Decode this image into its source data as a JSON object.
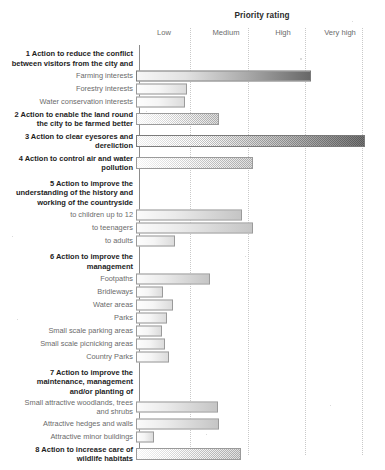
{
  "chart_data": {
    "type": "bar",
    "orientation": "horizontal",
    "title": "Priority rating",
    "xlabel": "",
    "ylabel": "",
    "grid": true,
    "legend": "none",
    "tick_labels": [
      "Low",
      "Medium",
      "High",
      "Very high"
    ],
    "tick_positions": [
      0.9,
      2.0,
      3.0,
      4.0
    ],
    "xlim": [
      0,
      4.4
    ],
    "categories": [
      "1 Action to reduce the conflict between visitors from the city and",
      "Farming interests",
      "Forestry interests",
      "Water conservation interests",
      "2 Action to enable the land round the city to be farmed better",
      "3 Action to clear eyesores and dereliction",
      "4 Action to control air and water pollution",
      "5 Action to improve the understanding of the history and working of the countryside",
      "to children up to 12",
      "to teenagers",
      "to adults",
      "6 Action to improve the management",
      "Footpaths",
      "Bridleways",
      "Water areas",
      "Parks",
      "Small scale parking areas",
      "Small scale picnicking areas",
      "Country Parks",
      "7 Action to improve the maintenance, management and/or planting of",
      "Small attractive woodlands, trees and shrubs",
      "Attractive hedges and walls",
      "Attractive minor buildings",
      "8 Action to increase care of wildlife habitats"
    ],
    "values": [
      null,
      3.1,
      0.9,
      0.88,
      1.5,
      4.1,
      2.1,
      null,
      1.9,
      2.1,
      0.7,
      null,
      1.33,
      0.49,
      0.67,
      0.56,
      0.47,
      0.52,
      0.6,
      null,
      1.48,
      1.5,
      0.32,
      1.88
    ]
  },
  "chart": {
    "title": "Priority rating",
    "axis": {
      "ticks": [
        {
          "label": "Low",
          "x_px": 164
        },
        {
          "label": "Medium",
          "x_px": 226
        },
        {
          "label": "High",
          "x_px": 283
        },
        {
          "label": "Very high",
          "x_px": 340
        }
      ],
      "gridlines_px": [
        190,
        248,
        305,
        362
      ]
    },
    "rows": [
      {
        "id": "heading-1",
        "label": "1 Action to reduce the conflict\nbetween visitors from the city and",
        "kind": "heading",
        "clipped": true,
        "bar": null,
        "top": 48,
        "height": 21
      },
      {
        "id": "farming-interests",
        "label": "Farming interests",
        "kind": "item",
        "bar": {
          "width_px": 175,
          "style": "dark"
        },
        "top": 69,
        "height": 13
      },
      {
        "id": "forestry-interests",
        "label": "Forestry interests",
        "kind": "item",
        "bar": {
          "width_px": 51,
          "style": "light"
        },
        "top": 82,
        "height": 13
      },
      {
        "id": "water-conservation-interests",
        "label": "Water conservation interests",
        "kind": "item",
        "bar": {
          "width_px": 49,
          "style": "light"
        },
        "top": 95,
        "height": 13
      },
      {
        "id": "heading-2",
        "label": "2 Action to enable the land round\nthe city to be farmed better",
        "kind": "heading",
        "bar": {
          "width_px": 83,
          "style": "normal"
        },
        "top": 108,
        "height": 22
      },
      {
        "id": "heading-3",
        "label": "3 Action to clear eyesores and\ndereliction",
        "kind": "heading",
        "bar": {
          "width_px": 229,
          "style": "dark"
        },
        "top": 130,
        "height": 22
      },
      {
        "id": "heading-4",
        "label": "4 Action to control air and water\npollution",
        "kind": "heading",
        "bar": {
          "width_px": 117,
          "style": "normal"
        },
        "top": 152,
        "height": 22
      },
      {
        "id": "heading-5",
        "label": "5 Action to improve the\nunderstanding of the history and\nworking of the countryside",
        "kind": "heading",
        "bar": null,
        "top": 178,
        "height": 30
      },
      {
        "id": "to-children-up-to-12",
        "label": "to children up to 12",
        "kind": "item",
        "bar": {
          "width_px": 106,
          "style": "normal"
        },
        "top": 208,
        "height": 13
      },
      {
        "id": "to-teenagers",
        "label": "to teenagers",
        "kind": "item",
        "bar": {
          "width_px": 117,
          "style": "normal"
        },
        "top": 221,
        "height": 13
      },
      {
        "id": "to-adults",
        "label": "to adults",
        "kind": "item",
        "bar": {
          "width_px": 39,
          "style": "light"
        },
        "top": 234,
        "height": 13
      },
      {
        "id": "heading-6",
        "label": "6 Action to improve the\nmanagement",
        "kind": "heading",
        "bar": null,
        "top": 251,
        "height": 21
      },
      {
        "id": "footpaths",
        "label": "Footpaths",
        "kind": "item",
        "bar": {
          "width_px": 74,
          "style": "normal"
        },
        "top": 272,
        "height": 13
      },
      {
        "id": "bridleways",
        "label": "Bridleways",
        "kind": "item",
        "bar": {
          "width_px": 27,
          "style": "light"
        },
        "top": 285,
        "height": 13
      },
      {
        "id": "water-areas",
        "label": "Water areas",
        "kind": "item",
        "bar": {
          "width_px": 37,
          "style": "light"
        },
        "top": 298,
        "height": 13
      },
      {
        "id": "parks",
        "label": "Parks",
        "kind": "item",
        "bar": {
          "width_px": 31,
          "style": "light"
        },
        "top": 311,
        "height": 13
      },
      {
        "id": "small-scale-parking-areas",
        "label": "Small scale parking areas",
        "kind": "item",
        "bar": {
          "width_px": 26,
          "style": "light"
        },
        "top": 324,
        "height": 13
      },
      {
        "id": "small-scale-picnicking-areas",
        "label": "Small scale picnicking areas",
        "kind": "item",
        "bar": {
          "width_px": 29,
          "style": "light"
        },
        "top": 337,
        "height": 13
      },
      {
        "id": "country-parks",
        "label": "Country Parks",
        "kind": "item",
        "bar": {
          "width_px": 33,
          "style": "light"
        },
        "top": 350,
        "height": 13
      },
      {
        "id": "heading-7",
        "label": "7 Action to improve the\nmaintenance, management\nand/or planting of",
        "kind": "heading",
        "bar": null,
        "top": 367,
        "height": 30
      },
      {
        "id": "small-attractive-woodlands",
        "label": "Small attractive woodlands, trees\nand shrubs",
        "kind": "item",
        "bar": {
          "width_px": 82,
          "style": "normal"
        },
        "top": 397,
        "height": 20
      },
      {
        "id": "attractive-hedges-and-walls",
        "label": "Attractive hedges and walls",
        "kind": "item",
        "bar": {
          "width_px": 83,
          "style": "normal"
        },
        "top": 417,
        "height": 13
      },
      {
        "id": "attractive-minor-buildings",
        "label": "Attractive minor buildings",
        "kind": "item",
        "bar": {
          "width_px": 18,
          "style": "light"
        },
        "top": 430,
        "height": 13
      },
      {
        "id": "heading-8",
        "label": "8 Action to increase care of\nwildlife habitats",
        "kind": "heading",
        "bar": {
          "width_px": 105,
          "style": "normal"
        },
        "top": 443,
        "height": 22
      }
    ]
  }
}
